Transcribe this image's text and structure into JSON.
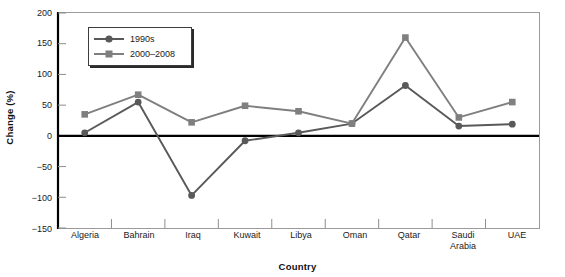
{
  "chart_data": {
    "type": "line",
    "title": "",
    "xlabel": "Country",
    "ylabel": "Change (%)",
    "categories": [
      "Algeria",
      "Bahrain",
      "Iraq",
      "Kuwait",
      "Libya",
      "Oman",
      "Qatar",
      "Saudi Arabia",
      "UAE"
    ],
    "series": [
      {
        "name": "1990s",
        "marker": "circle",
        "color": "#595959",
        "values": [
          5,
          55,
          -97,
          -8,
          5,
          20,
          82,
          16,
          19
        ]
      },
      {
        "name": "2000–2008",
        "marker": "square",
        "color": "#7f7f7f",
        "values": [
          35,
          67,
          22,
          49,
          40,
          20,
          160,
          30,
          55
        ]
      }
    ],
    "ylim": [
      -150,
      200
    ],
    "yticks": [
      -150,
      -100,
      -50,
      0,
      50,
      100,
      150,
      200
    ],
    "ytick_labels": [
      "−150",
      "−100",
      "−50",
      "0",
      "50",
      "100",
      "150",
      "200"
    ],
    "grid": false,
    "legend_position": "upper-left",
    "zero_line": true
  },
  "axes": {
    "x_title": "Country",
    "y_title": "Change (%)"
  },
  "legend": {
    "entries": [
      {
        "label": "1990s"
      },
      {
        "label": "2000–2008"
      }
    ]
  },
  "colors": {
    "series_1990s": "#595959",
    "series_2000_2008": "#7f7f7f",
    "axis": "#000000",
    "frame": "#9a9a9a",
    "background": "#ffffff"
  }
}
